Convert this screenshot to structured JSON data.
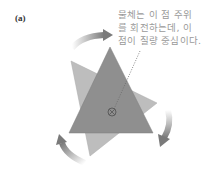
{
  "figure": {
    "panel_label": "(a)",
    "caption_lines": [
      "물체는 이 점 주위",
      "를 회전하는데, 이",
      "점이 질량 중심이다."
    ],
    "colors": {
      "dark_triangle": "#8f8f8f",
      "light_triangle": "#bdbdbd",
      "arrow": "#7a7a7a",
      "caption_text": "#9a9a9a",
      "dotted_line": "#6a6a6a"
    },
    "elements": {
      "dark_triangle": "object-current-orientation",
      "light_triangle": "object-rotated-orientation",
      "center_marker": "center-of-mass-marker",
      "arrows": [
        "rotation-arrow-top",
        "rotation-arrow-right",
        "rotation-arrow-bottom-left"
      ]
    }
  }
}
